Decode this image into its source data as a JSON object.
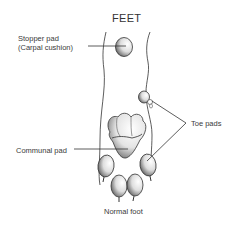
{
  "diagram": {
    "title": "FEET",
    "caption": "Normal foot",
    "labels": {
      "stopper_pad_line1": "Stopper pad",
      "stopper_pad_line2": "(Carpal cushion)",
      "communal_pad": "Communal pad",
      "toe_pads": "Toe pads"
    },
    "colors": {
      "line": "#333333",
      "text": "#3a3a3a",
      "background": "#ffffff"
    }
  }
}
